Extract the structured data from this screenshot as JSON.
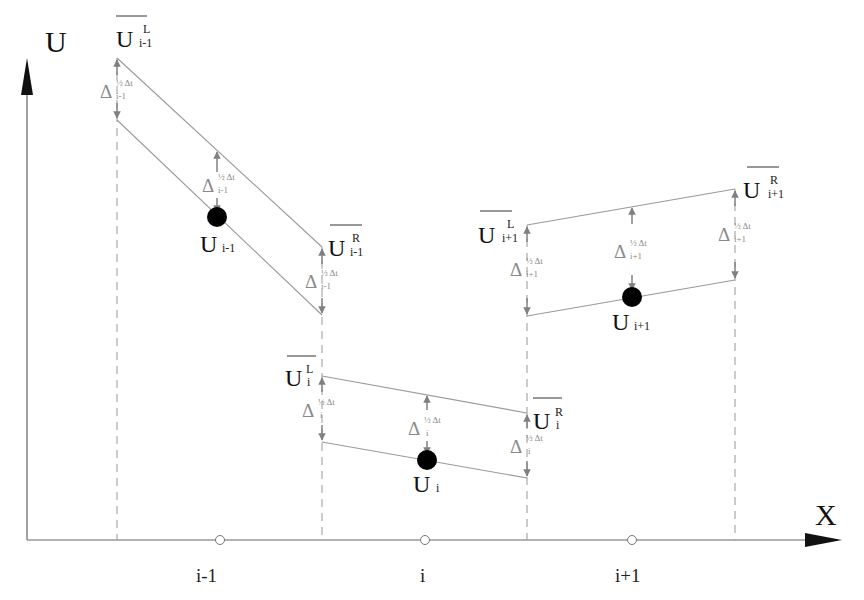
{
  "axes": {
    "y_label": "U",
    "x_label": "X",
    "x_ticks": [
      "i-1",
      "i",
      "i+1"
    ]
  },
  "cells": [
    {
      "index": "i-1",
      "avg_label": "U",
      "avg_sub": "i-1",
      "left_label": "U",
      "left_sup": "L",
      "left_sub": "i-1",
      "right_label": "U",
      "right_sup": "R",
      "right_sub": "i-1",
      "delta_symbol": "Δ",
      "delta_sup": "½ Δt",
      "delta_sub": "i-1"
    },
    {
      "index": "i",
      "avg_label": "U",
      "avg_sub": "i",
      "left_label": "U",
      "left_sup": "L",
      "left_sub": "i",
      "right_label": "U",
      "right_sup": "R",
      "right_sub": "i",
      "delta_symbol": "Δ",
      "delta_sup": "½ Δt",
      "delta_sub": "i"
    },
    {
      "index": "i+1",
      "avg_label": "U",
      "avg_sub": "i+1",
      "left_label": "U",
      "left_sup": "L",
      "left_sub": "i+1",
      "right_label": "U",
      "right_sup": "R",
      "right_sub": "i+1",
      "delta_symbol": "Δ",
      "delta_sup": "½ Δt",
      "delta_sub": "i+1"
    }
  ],
  "colors": {
    "line": "#9a9a9a",
    "arrow": "#808080",
    "axis": "#555555",
    "dot": "#000000",
    "text": "#111111"
  }
}
